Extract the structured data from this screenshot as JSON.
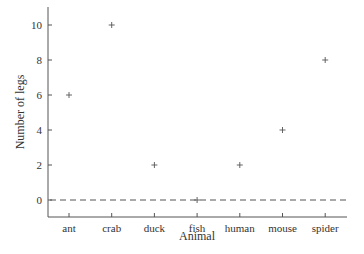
{
  "chart_data": {
    "type": "scatter",
    "title": "",
    "xlabel": "Animal",
    "ylabel": "Number of legs",
    "categories": [
      "ant",
      "crab",
      "duck",
      "fish",
      "human",
      "mouse",
      "spider"
    ],
    "values": [
      6,
      10,
      2,
      0,
      2,
      4,
      8
    ],
    "marker": "+",
    "yticks": [
      0,
      2,
      4,
      6,
      8,
      10
    ],
    "ylim": [
      -1,
      11
    ],
    "grid": false,
    "legend": null,
    "reference_line": {
      "y": 0,
      "style": "dashed"
    },
    "colors": {
      "axis": "#555555",
      "marker": "#555555",
      "text": "#333333"
    }
  }
}
